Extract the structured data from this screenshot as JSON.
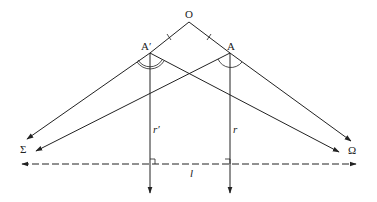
{
  "diagram": {
    "type": "geometric-ray-diagram",
    "labels": {
      "origin": "O",
      "point_a": "A",
      "point_a_prime": "A′",
      "sigma": "Σ",
      "omega": "Ω",
      "ray_r": "r",
      "ray_r_prime": "r′",
      "line_l": "l"
    },
    "points": {
      "O": [
        189,
        22
      ],
      "A_prime": [
        150,
        53
      ],
      "A": [
        230,
        53
      ]
    },
    "line_color": "#222222",
    "background": "#ffffff"
  }
}
